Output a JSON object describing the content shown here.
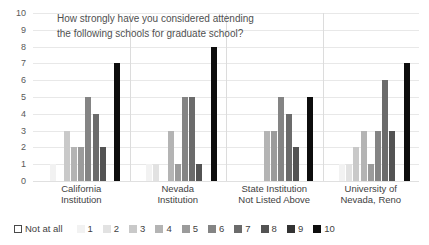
{
  "chart_data": {
    "type": "bar",
    "title": "How strongly have you considered attending the following schools for graduate school?",
    "title_line1": "How strongly have you considered attending",
    "title_line2": "the following schools for graduate school?",
    "xlabel": "",
    "ylabel": "",
    "ylim": [
      0,
      10
    ],
    "yticks": [
      10,
      9,
      8,
      7,
      6,
      5,
      4,
      3,
      2,
      1,
      0
    ],
    "grid": true,
    "legend_position": "bottom",
    "categories": [
      "California Institution",
      "Nevada Institution",
      "State Institution Not Listed Above",
      "University of Nevada, Reno"
    ],
    "category_lines": [
      [
        "California",
        "Institution"
      ],
      [
        "Nevada",
        "Institution"
      ],
      [
        "State Institution",
        "Not Listed Above"
      ],
      [
        "University of",
        "Nevada, Reno"
      ]
    ],
    "series": [
      {
        "name": "Not at all",
        "color": "#ffffff",
        "values": [
          0,
          0,
          0,
          0
        ]
      },
      {
        "name": "1",
        "color": "#f2f2f2",
        "values": [
          1,
          1,
          0,
          1
        ]
      },
      {
        "name": "2",
        "color": "#e2e2e2",
        "values": [
          0,
          1,
          0,
          1
        ]
      },
      {
        "name": "3",
        "color": "#c9c9c9",
        "values": [
          3,
          0,
          0,
          2
        ]
      },
      {
        "name": "4",
        "color": "#b4b4b4",
        "values": [
          2,
          3,
          3,
          3
        ]
      },
      {
        "name": "5",
        "color": "#9b9b9b",
        "values": [
          2,
          1,
          3,
          1
        ]
      },
      {
        "name": "6",
        "color": "#848484",
        "values": [
          5,
          5,
          5,
          3
        ]
      },
      {
        "name": "7",
        "color": "#6b6b6b",
        "values": [
          4,
          5,
          4,
          6
        ]
      },
      {
        "name": "8",
        "color": "#535353",
        "values": [
          2,
          1,
          2,
          3
        ]
      },
      {
        "name": "9",
        "color": "#333333",
        "values": [
          0,
          0,
          0,
          0
        ]
      },
      {
        "name": "10",
        "color": "#0d0d0d",
        "values": [
          7,
          8,
          5,
          7
        ]
      }
    ]
  }
}
